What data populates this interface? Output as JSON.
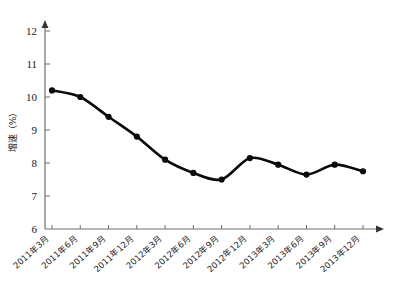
{
  "chart_data": {
    "type": "line",
    "title": "",
    "subtitle": "",
    "xlabel": "",
    "ylabel": "增速（%）",
    "ylim": [
      6,
      12
    ],
    "yticks": [
      6,
      7,
      8,
      9,
      10,
      11,
      12
    ],
    "ytick_labels": [
      "6",
      "7",
      "8",
      "9",
      "10",
      "11",
      "12"
    ],
    "grid": false,
    "legend": false,
    "legend_position": "none",
    "marker": "filled-circle",
    "line_color": "#0a0a0a",
    "axis_color": "#6e6e6e",
    "categories": [
      "2011年3月",
      "2011年6月",
      "2011年9月",
      "2011年12月",
      "2012年3月",
      "2012年6月",
      "2012年9月",
      "2012年12月",
      "2013年3月",
      "2013年6月",
      "2013年9月",
      "2013年12月"
    ],
    "series": [
      {
        "name": "增速",
        "values": [
          10.2,
          10.0,
          9.4,
          8.8,
          8.1,
          7.7,
          7.5,
          8.15,
          7.95,
          7.65,
          7.95,
          7.75
        ]
      }
    ]
  }
}
